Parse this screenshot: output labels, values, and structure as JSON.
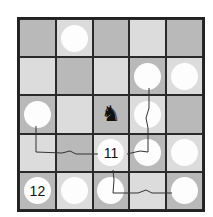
{
  "board": {
    "size": 5,
    "cells": [
      [
        {
          "shade": "dark"
        },
        {
          "shade": "light",
          "circle": true
        },
        {
          "shade": "dark"
        },
        {
          "shade": "light"
        },
        {
          "shade": "dark"
        }
      ],
      [
        {
          "shade": "light"
        },
        {
          "shade": "dark"
        },
        {
          "shade": "light"
        },
        {
          "shade": "dark",
          "circle": true
        },
        {
          "shade": "light",
          "circle": true
        }
      ],
      [
        {
          "shade": "dark",
          "circle": true
        },
        {
          "shade": "light"
        },
        {
          "shade": "dark",
          "piece": "knight"
        },
        {
          "shade": "light",
          "circle": true
        },
        {
          "shade": "dark"
        }
      ],
      [
        {
          "shade": "light"
        },
        {
          "shade": "dark"
        },
        {
          "shade": "light",
          "circle": true,
          "label": "11"
        },
        {
          "shade": "dark",
          "circle": true
        },
        {
          "shade": "light",
          "circle": true
        }
      ],
      [
        {
          "shade": "dark",
          "circle": true,
          "label": "12"
        },
        {
          "shade": "light",
          "circle": true
        },
        {
          "shade": "dark",
          "circle": true
        },
        {
          "shade": "light"
        },
        {
          "shade": "dark",
          "circle": true
        }
      ]
    ]
  },
  "labels": {
    "center_count": "11",
    "corner_count": "12"
  },
  "pieces": {
    "knight_glyph": "♞"
  },
  "colors": {
    "dark_square": "#b9b9b9",
    "light_square": "#dcdcdc",
    "circle": "#fdfdfd",
    "line": "#333333"
  }
}
